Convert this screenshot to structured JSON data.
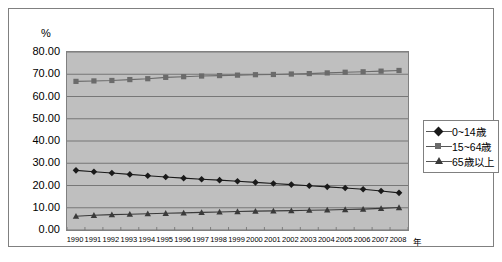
{
  "chart_data": {
    "type": "line",
    "title": "",
    "xlabel": "年",
    "ylabel": "%",
    "ylim": [
      0,
      80
    ],
    "ytick_step": 10,
    "ytick_labels": [
      "80.00",
      "70.00",
      "60.00",
      "50.00",
      "40.00",
      "30.00",
      "20.00",
      "10.00",
      "0.00"
    ],
    "grid": true,
    "legend_position": "right",
    "plot_background": "#bfbfbf",
    "categories": [
      1990,
      1991,
      1992,
      1993,
      1994,
      1995,
      1996,
      1997,
      1998,
      1999,
      2000,
      2001,
      2002,
      2003,
      2004,
      2005,
      2006,
      2007,
      2008
    ],
    "x_tick_labels": [
      "1990",
      "1991",
      "1992",
      "1993",
      "1994",
      "1995",
      "1996",
      "1997",
      "1998",
      "1999",
      "2000",
      "2001",
      "2002",
      "2003",
      "2004",
      "2005",
      "2006",
      "2007",
      "2008"
    ],
    "series": [
      {
        "name": "0~14歳",
        "marker": "diamond",
        "color": "#1a1a1a",
        "values": [
          26.8,
          26.2,
          25.6,
          25.0,
          24.4,
          23.8,
          23.3,
          22.8,
          22.4,
          21.9,
          21.4,
          20.9,
          20.4,
          19.9,
          19.4,
          18.9,
          18.3,
          17.5,
          16.7
        ]
      },
      {
        "name": "15~64歳",
        "marker": "square",
        "color": "#6b6b6b",
        "values": [
          66.8,
          67.0,
          67.2,
          67.6,
          68.0,
          68.6,
          68.9,
          69.2,
          69.4,
          69.6,
          69.8,
          69.9,
          70.1,
          70.3,
          70.6,
          70.9,
          71.1,
          71.4,
          71.7
        ]
      },
      {
        "name": "65歳以上",
        "marker": "triangle",
        "color": "#3a3a3a",
        "values": [
          6.2,
          6.6,
          6.9,
          7.1,
          7.3,
          7.5,
          7.7,
          7.9,
          8.1,
          8.3,
          8.5,
          8.6,
          8.7,
          8.9,
          9.0,
          9.2,
          9.4,
          9.7,
          10.1
        ]
      }
    ]
  },
  "axis": {
    "y_unit": "%",
    "x_unit": "年"
  },
  "legend": {
    "entries": [
      {
        "label": "0~14歳"
      },
      {
        "label": "15~64歳"
      },
      {
        "label": "65歳以上"
      }
    ]
  }
}
